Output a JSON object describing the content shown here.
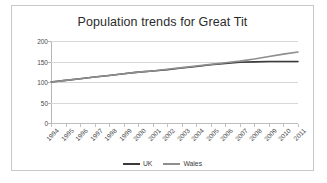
{
  "chart_data": {
    "type": "line",
    "title": "Population trends for Great Tit",
    "xlabel": "",
    "ylabel": "",
    "ylim": [
      0,
      200
    ],
    "yticks": [
      0,
      50,
      100,
      150,
      200
    ],
    "grid": true,
    "legend_position": "bottom",
    "categories": [
      "1994",
      "1995",
      "1996",
      "1997",
      "1998",
      "1999",
      "2000",
      "2001",
      "2002",
      "2003",
      "2004",
      "2005",
      "2006",
      "2007",
      "2008",
      "2009",
      "2010",
      "2011"
    ],
    "series": [
      {
        "name": "UK",
        "color": "#3a3a3a",
        "values": [
          100,
          104,
          108,
          112,
          116,
          120,
          124,
          127,
          130,
          134,
          138,
          142,
          145,
          148,
          149,
          150,
          150,
          150
        ]
      },
      {
        "name": "Wales",
        "color": "#8e8e8e",
        "values": [
          100,
          104,
          108,
          112,
          116,
          120,
          124,
          127,
          131,
          135,
          139,
          143,
          147,
          151,
          156,
          162,
          168,
          173
        ]
      }
    ]
  },
  "legend": {
    "items": [
      {
        "label": "UK"
      },
      {
        "label": "Wales"
      }
    ]
  },
  "colors": {
    "uk_line": "#3a3a3a",
    "wales_line": "#8e8e8e",
    "gridline": "#d7d7d7",
    "frame_border": "#c9c9c9",
    "axis": "#b5b5b5",
    "text": "#2b2b2b"
  }
}
